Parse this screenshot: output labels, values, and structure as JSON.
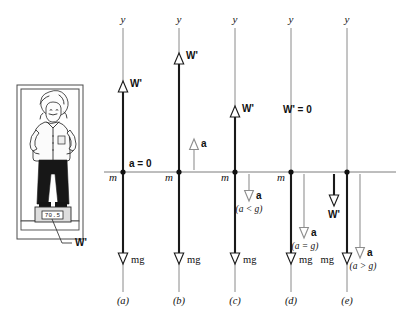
{
  "figure": {
    "title_hidden": "Free-body diagrams of apparent weight in an accelerating elevator",
    "axis_label": "y",
    "mass_label": "m",
    "weight_label": "W'",
    "weight_zero_label": "W' = 0",
    "gravity_label": "mg",
    "accel_label": "a",
    "accel_zero_label": "a = 0"
  },
  "illustration": {
    "scale_reading": "70.5",
    "callout_label": "W'"
  },
  "panels": [
    {
      "id": "a",
      "caption": "(a)",
      "center_x": 123,
      "accel_text": "a = 0",
      "accel_condition": "",
      "weight_label": "W'",
      "weight_direction": "up",
      "weight_magnitude": "equal",
      "gravity_label": "mg",
      "mass_label": "m",
      "axis_label": "y"
    },
    {
      "id": "b",
      "caption": "(b)",
      "center_x": 179,
      "accel_text": "a",
      "accel_condition": "",
      "weight_label": "W'",
      "weight_direction": "up",
      "weight_magnitude": "greater",
      "gravity_label": "mg",
      "mass_label": "m",
      "axis_label": "y"
    },
    {
      "id": "c",
      "caption": "(c)",
      "center_x": 235,
      "accel_text": "a",
      "accel_condition": "(a < g)",
      "weight_label": "W'",
      "weight_direction": "up",
      "weight_magnitude": "less",
      "gravity_label": "mg",
      "mass_label": "m",
      "axis_label": "y"
    },
    {
      "id": "d",
      "caption": "(d)",
      "center_x": 291,
      "accel_text": "a",
      "accel_condition": "(a = g)",
      "weight_label": "W' = 0",
      "weight_direction": "none",
      "weight_magnitude": "zero",
      "gravity_label": "mg",
      "mass_label": "m",
      "axis_label": "y"
    },
    {
      "id": "e",
      "caption": "(e)",
      "center_x": 347,
      "accel_text": "a",
      "accel_condition": "(a > g)",
      "weight_label": "W'",
      "weight_direction": "down",
      "weight_magnitude": "negative",
      "gravity_label": "mg",
      "mass_label": "m",
      "axis_label": "y"
    }
  ],
  "colors": {
    "ink": "#111111",
    "axis_gray": "#8a8a8a",
    "vector_thin": "#9a9a9a",
    "pants": "#171717",
    "paper": "#ffffff"
  }
}
